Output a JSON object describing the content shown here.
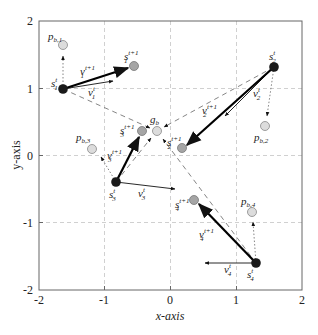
{
  "axes": {
    "xlabel": "x-axis",
    "ylabel": "y-axis",
    "xticks": [
      "-2",
      "-1",
      "0",
      "1",
      "2"
    ],
    "yticks": [
      "2",
      "1",
      "0",
      "-1",
      "-2"
    ],
    "xlim": [
      -2,
      2
    ],
    "ylim": [
      -2,
      2
    ],
    "grid": "dashed"
  },
  "labels": {
    "pb1": "p",
    "pb1_sub": "b,1",
    "pb2": "p",
    "pb2_sub": "b,2",
    "pb3": "p",
    "pb3_sub": "b,3",
    "pb4": "p",
    "pb4_sub": "b,4",
    "gb": "g",
    "gb_sub": "b",
    "s1t": "s",
    "s1t_sub": "1",
    "s1t_sup": "t",
    "s1n": "s",
    "s1n_sub": "1",
    "s1n_sup": "t+1",
    "s2t": "s",
    "s2t_sub": "2",
    "s2t_sup": "t",
    "s2n": "s",
    "s2n_sub": "2",
    "s2n_sup": "t+1",
    "s3t": "s",
    "s3t_sub": "3",
    "s3t_sup": "t",
    "s3n": "s",
    "s3n_sub": "3",
    "s3n_sup": "t+1",
    "s4t": "s",
    "s4t_sub": "4",
    "s4t_sup": "t",
    "s4n": "s",
    "s4n_sub": "4",
    "s4n_sup": "t+1",
    "v1t": "v",
    "v1t_sub": "1",
    "v1t_sup": "t",
    "v1n": "v",
    "v1n_sub": "1",
    "v1n_sup": "t+1",
    "v2t": "v",
    "v2t_sub": "2",
    "v2t_sup": "t",
    "v2n": "v",
    "v2n_sub": "2",
    "v2n_sup": "t+1",
    "v3t": "v",
    "v3t_sub": "3",
    "v3t_sup": "t",
    "v3n": "v",
    "v3n_sub": "3",
    "v3n_sup": "t+1",
    "v4t": "v",
    "v4t_sub": "4",
    "v4t_sup": "t",
    "v4n": "v",
    "v4n_sub": "4",
    "v4n_sup": "t+1"
  },
  "points": {
    "s1_t": [
      -1.65,
      0.98
    ],
    "s1_t1": [
      -0.55,
      1.33
    ],
    "p_b1": [
      -1.63,
      1.65
    ],
    "s2_t": [
      1.57,
      1.32
    ],
    "s2_t1": [
      0.2,
      0.13
    ],
    "p_b2": [
      1.43,
      0.45
    ],
    "s3_t": [
      -0.8,
      -0.38
    ],
    "s3_t1": [
      -0.42,
      0.36
    ],
    "p_b3": [
      -1.2,
      0.12
    ],
    "s4_t": [
      1.3,
      -1.57
    ],
    "s4_t1": [
      0.37,
      -0.65
    ],
    "p_b4": [
      1.25,
      -0.82
    ],
    "g_b": [
      -0.19,
      0.37
    ]
  },
  "colors": {
    "current": "#222222",
    "next": "#a8a8a8",
    "personal_best": "#d8d8d8",
    "grid": "#bdbdbd"
  }
}
